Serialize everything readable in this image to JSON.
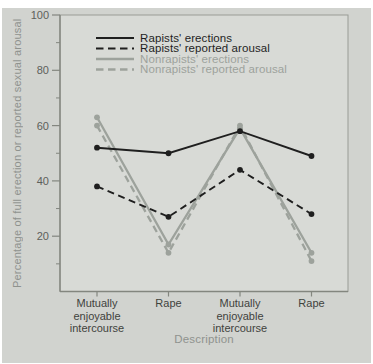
{
  "colors": {
    "panel_bg": "#d1d3cf",
    "plot_bg": "#d8dad6",
    "box": "#999c96",
    "axis": "#83867f",
    "tick_text": "#5d605b",
    "category_text": "#3f423d",
    "muted_text": "#8f928e",
    "black": "#1f1f1f",
    "gray": "#9da29c"
  },
  "chart_data": {
    "type": "line",
    "title": "",
    "xlabel": "Description",
    "ylabel": "Percentage of full erection or reported sexual arousal",
    "ylim": [
      0,
      100
    ],
    "yticks": [
      20,
      40,
      60,
      80,
      100
    ],
    "yticks_minor": [
      10,
      30,
      50,
      70,
      90
    ],
    "grid": false,
    "legend_position": "top-left-inside",
    "categories": [
      [
        "Mutually",
        "enjoyable",
        "intercourse"
      ],
      [
        "Rape"
      ],
      [
        "Mutually",
        "enjoyable",
        "intercourse"
      ],
      [
        "Rape"
      ]
    ],
    "series": [
      {
        "name": "Rapists' erections",
        "style": "solid",
        "color_key": "black",
        "values": [
          52,
          50,
          58,
          49
        ]
      },
      {
        "name": "Rapists' reported arousal",
        "style": "dashed",
        "color_key": "black",
        "values": [
          38,
          27,
          44,
          28
        ]
      },
      {
        "name": "Nonrapists' erections",
        "style": "solid",
        "color_key": "gray",
        "values": [
          63,
          17,
          59,
          14
        ]
      },
      {
        "name": "Nonrapists' reported arousal",
        "style": "dashed",
        "color_key": "gray",
        "values": [
          60,
          14,
          60,
          11
        ]
      }
    ]
  }
}
